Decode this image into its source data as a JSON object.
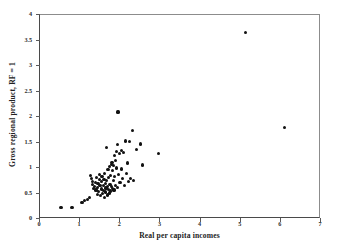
{
  "chart_data": {
    "type": "scatter",
    "title": "",
    "xlabel": "Real per capita incomes",
    "ylabel": "Gross regional product, RF = 1",
    "xlim": [
      0,
      7
    ],
    "ylim": [
      0,
      4
    ],
    "xticks": [
      "0",
      "1",
      "2",
      "3",
      "4",
      "5",
      "6",
      "7"
    ],
    "xtick_values": [
      0,
      1,
      2,
      3,
      4,
      5,
      6,
      7
    ],
    "yticks": [
      "0",
      "0.5",
      "1",
      "1.5",
      "2",
      "2.5",
      "3",
      "3.5",
      "4"
    ],
    "ytick_values": [
      0,
      0.5,
      1,
      1.5,
      2,
      2.5,
      3,
      3.5,
      4
    ],
    "grid": false,
    "legend": null,
    "marker": "filled-circle",
    "marker_color": "#111111",
    "frame_color": "#4a4a4a",
    "background": "#ffffff",
    "n_points": 83,
    "points": [
      [
        0.55,
        0.21
      ],
      [
        0.82,
        0.21
      ],
      [
        1.07,
        0.31
      ],
      [
        1.14,
        0.34
      ],
      [
        1.21,
        0.36
      ],
      [
        1.25,
        0.4
      ],
      [
        1.28,
        0.83
      ],
      [
        1.3,
        0.78
      ],
      [
        1.33,
        0.66
      ],
      [
        1.34,
        0.72
      ],
      [
        1.36,
        0.58
      ],
      [
        1.38,
        0.62
      ],
      [
        1.4,
        0.7
      ],
      [
        1.42,
        0.55
      ],
      [
        1.43,
        0.8
      ],
      [
        1.45,
        0.46
      ],
      [
        1.46,
        0.6
      ],
      [
        1.47,
        0.68
      ],
      [
        1.49,
        0.52
      ],
      [
        1.5,
        0.75
      ],
      [
        1.51,
        0.86
      ],
      [
        1.52,
        0.64
      ],
      [
        1.53,
        0.44
      ],
      [
        1.55,
        0.57
      ],
      [
        1.56,
        0.71
      ],
      [
        1.57,
        0.82
      ],
      [
        1.58,
        0.48
      ],
      [
        1.6,
        0.63
      ],
      [
        1.61,
        0.54
      ],
      [
        1.62,
        0.76
      ],
      [
        1.63,
        0.4
      ],
      [
        1.64,
        0.88
      ],
      [
        1.65,
        0.67
      ],
      [
        1.66,
        0.51
      ],
      [
        1.67,
        0.59
      ],
      [
        1.68,
        1.38
      ],
      [
        1.69,
        0.73
      ],
      [
        1.7,
        0.45
      ],
      [
        1.71,
        0.61
      ],
      [
        1.72,
        0.95
      ],
      [
        1.73,
        0.56
      ],
      [
        1.74,
        0.79
      ],
      [
        1.75,
        0.49
      ],
      [
        1.76,
        1.01
      ],
      [
        1.77,
        0.65
      ],
      [
        1.78,
        0.53
      ],
      [
        1.79,
        0.84
      ],
      [
        1.8,
        1.05
      ],
      [
        1.81,
        0.62
      ],
      [
        1.82,
        1.09
      ],
      [
        1.83,
        0.58
      ],
      [
        1.84,
        0.93
      ],
      [
        1.85,
        1.03
      ],
      [
        1.86,
        0.74
      ],
      [
        1.87,
        0.55
      ],
      [
        1.88,
        1.22
      ],
      [
        1.89,
        0.81
      ],
      [
        1.9,
        1.12
      ],
      [
        1.91,
        0.63
      ],
      [
        1.93,
        1.3
      ],
      [
        1.94,
        0.98
      ],
      [
        1.95,
        1.44
      ],
      [
        1.96,
        0.6
      ],
      [
        1.97,
        2.08
      ],
      [
        1.98,
        0.86
      ],
      [
        2.0,
        1.26
      ],
      [
        2.02,
        0.7
      ],
      [
        2.05,
        1.33
      ],
      [
        2.06,
        0.96
      ],
      [
        2.08,
        0.78
      ],
      [
        2.1,
        1.29
      ],
      [
        2.12,
        0.64
      ],
      [
        2.15,
        1.51
      ],
      [
        2.17,
        0.88
      ],
      [
        2.2,
        1.08
      ],
      [
        2.22,
        0.72
      ],
      [
        2.25,
        1.5
      ],
      [
        2.28,
        0.77
      ],
      [
        2.32,
        1.72
      ],
      [
        2.36,
        0.73
      ],
      [
        2.42,
        1.34
      ],
      [
        2.52,
        1.45
      ],
      [
        2.58,
        1.04
      ],
      [
        2.97,
        1.27
      ],
      [
        5.15,
        3.63
      ],
      [
        6.12,
        1.78
      ]
    ]
  }
}
